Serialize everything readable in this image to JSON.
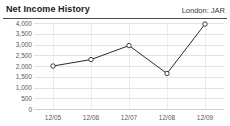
{
  "header": {
    "title": "Net Income History",
    "meta": "London: JAR"
  },
  "chart_data": {
    "type": "line",
    "title": "Net Income History",
    "subtitle": "London: JAR",
    "xlabel": "",
    "ylabel": "",
    "categories": [
      "12/05",
      "12/06",
      "12/07",
      "12/08",
      "12/09"
    ],
    "values": [
      2000,
      2300,
      2950,
      1650,
      3950
    ],
    "series": [
      {
        "name": "Net Income",
        "values": [
          2000,
          2300,
          2950,
          1650,
          3950
        ]
      }
    ],
    "ylim": [
      0,
      4000
    ],
    "yticks": [
      0,
      500,
      1000,
      1500,
      2000,
      2500,
      3000,
      3500,
      4000
    ],
    "ytick_labels": [
      "0",
      "500",
      "1,000",
      "1,500",
      "2,000",
      "2,500",
      "3,000",
      "3,500",
      "4,000"
    ],
    "xtick_labels": [
      "12/05",
      "12/06",
      "12/07",
      "12/08",
      "12/09"
    ],
    "grid": true,
    "grid_axis": "both",
    "legend": false,
    "legend_position": "none",
    "marker": "open-circle",
    "line_color": "#2b2b2b",
    "marker_fill": "#ffffff",
    "marker_stroke": "#2b2b2b",
    "grid_color": "#e2e2e2",
    "text_color": "#5a5a5a",
    "background": "#ffffff"
  }
}
